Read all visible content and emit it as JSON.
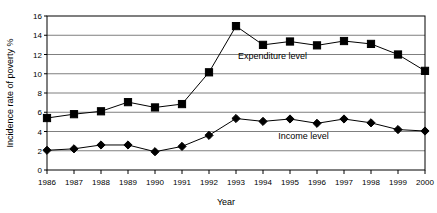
{
  "chart_data": {
    "type": "line",
    "title": "",
    "xlabel": "Year",
    "ylabel": "Incidence rate of poverty %",
    "x": [
      1986,
      1987,
      1988,
      1989,
      1990,
      1991,
      1992,
      1993,
      1994,
      1995,
      1996,
      1997,
      1998,
      1999,
      2000
    ],
    "categories": [
      "1986",
      "1987",
      "1988",
      "1989",
      "1990",
      "1991",
      "1992",
      "1993",
      "1994",
      "1995",
      "1996",
      "1997",
      "1998",
      "1999",
      "2000"
    ],
    "xlim": [
      1986,
      2000
    ],
    "ylim": [
      0,
      16
    ],
    "yticks": [
      0,
      2,
      4,
      6,
      8,
      10,
      12,
      14,
      16
    ],
    "ytick_labels": [
      "0",
      "2",
      "4",
      "6",
      "8",
      "10",
      "12",
      "14",
      "16"
    ],
    "grid": "horizontal",
    "legend_position": "inline-annotations",
    "series": [
      {
        "name": "Expenditure level",
        "marker": "square",
        "color": "#000000",
        "values": [
          5.4,
          5.8,
          6.1,
          7.05,
          6.5,
          6.85,
          10.15,
          14.95,
          13.0,
          13.35,
          12.95,
          13.4,
          13.1,
          12.0,
          10.3
        ]
      },
      {
        "name": "Income level",
        "marker": "diamond",
        "color": "#000000",
        "values": [
          2.05,
          2.2,
          2.6,
          2.6,
          1.9,
          2.45,
          3.6,
          5.35,
          5.05,
          5.3,
          4.85,
          5.3,
          4.9,
          4.2,
          4.05
        ]
      }
    ],
    "annotations": [
      {
        "text": "Expenditure level",
        "x": 1994.35,
        "y": 11.55
      },
      {
        "text": "Income level",
        "x": 1995.5,
        "y": 3.25
      }
    ]
  },
  "colors": {
    "axis": "#000000",
    "grid": "#7f7f7f",
    "series_line": "#000000",
    "marker_fill": "#000000",
    "background": "#ffffff"
  }
}
